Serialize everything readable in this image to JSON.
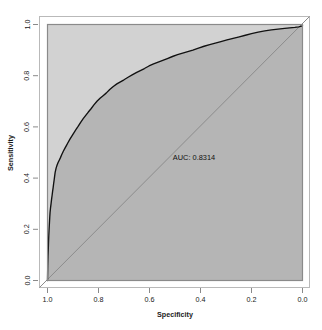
{
  "chart_data": {
    "type": "line",
    "title": "",
    "xlabel": "Specificity",
    "ylabel": "Sensitivity",
    "xlim": [
      1.0,
      0.0
    ],
    "ylim": [
      0.0,
      1.0
    ],
    "x_reversed": true,
    "grid": false,
    "legend": "none",
    "annotations": [
      {
        "text": "AUC: 0.8314",
        "x": 0.47,
        "y": 0.5
      }
    ],
    "xticks": [
      "1.0",
      "0.8",
      "0.6",
      "0.4",
      "0.2",
      "0.0"
    ],
    "xtick_values": [
      1.0,
      0.8,
      0.6,
      0.4,
      0.2,
      0.0
    ],
    "yticks": [
      "0.0",
      "0.2",
      "0.4",
      "0.6",
      "0.8",
      "1.0"
    ],
    "ytick_values": [
      0.0,
      0.2,
      0.4,
      0.6,
      0.8,
      1.0
    ],
    "auc": 0.8314,
    "series": [
      {
        "name": "ROC curve",
        "color": "#111111",
        "specificity": [
          1.0,
          0.999,
          0.998,
          0.997,
          0.996,
          0.995,
          0.994,
          0.993,
          0.992,
          0.991,
          0.99,
          0.988,
          0.986,
          0.984,
          0.982,
          0.98,
          0.978,
          0.976,
          0.974,
          0.972,
          0.97,
          0.966,
          0.962,
          0.958,
          0.954,
          0.95,
          0.944,
          0.938,
          0.932,
          0.926,
          0.92,
          0.912,
          0.904,
          0.896,
          0.888,
          0.88,
          0.87,
          0.86,
          0.85,
          0.84,
          0.83,
          0.818,
          0.806,
          0.794,
          0.782,
          0.77,
          0.756,
          0.742,
          0.728,
          0.714,
          0.7,
          0.684,
          0.668,
          0.652,
          0.636,
          0.62,
          0.602,
          0.584,
          0.566,
          0.548,
          0.53,
          0.51,
          0.49,
          0.47,
          0.45,
          0.43,
          0.408,
          0.386,
          0.364,
          0.342,
          0.32,
          0.296,
          0.272,
          0.248,
          0.224,
          0.2,
          0.174,
          0.148,
          0.122,
          0.096,
          0.07,
          0.05,
          0.03,
          0.015,
          0.0
        ],
        "sensitivity": [
          0.0,
          0.06,
          0.095,
          0.12,
          0.15,
          0.175,
          0.195,
          0.215,
          0.232,
          0.25,
          0.265,
          0.285,
          0.3,
          0.318,
          0.332,
          0.348,
          0.362,
          0.378,
          0.392,
          0.408,
          0.422,
          0.44,
          0.452,
          0.462,
          0.47,
          0.478,
          0.492,
          0.505,
          0.516,
          0.527,
          0.538,
          0.552,
          0.565,
          0.578,
          0.59,
          0.602,
          0.618,
          0.632,
          0.645,
          0.658,
          0.67,
          0.686,
          0.7,
          0.712,
          0.722,
          0.732,
          0.746,
          0.758,
          0.768,
          0.776,
          0.784,
          0.794,
          0.803,
          0.812,
          0.82,
          0.828,
          0.838,
          0.846,
          0.853,
          0.86,
          0.867,
          0.875,
          0.882,
          0.888,
          0.894,
          0.9,
          0.908,
          0.915,
          0.921,
          0.927,
          0.933,
          0.94,
          0.946,
          0.952,
          0.958,
          0.964,
          0.97,
          0.975,
          0.979,
          0.982,
          0.985,
          0.987,
          0.989,
          0.991,
          0.995
        ]
      },
      {
        "name": "chance diagonal",
        "color": "#8c8c8c",
        "specificity": [
          1.0,
          0.0
        ],
        "sensitivity": [
          0.0,
          1.0
        ]
      }
    ],
    "colors": {
      "fill_under_curve": "#b5b5b5",
      "plot_background": "#d2d2d2",
      "curve": "#111111",
      "diagonal": "#8c8c8c",
      "frame": "#8a8a8a",
      "outer_frame": "#b9b9b9",
      "page_background": "#ffffff"
    }
  }
}
